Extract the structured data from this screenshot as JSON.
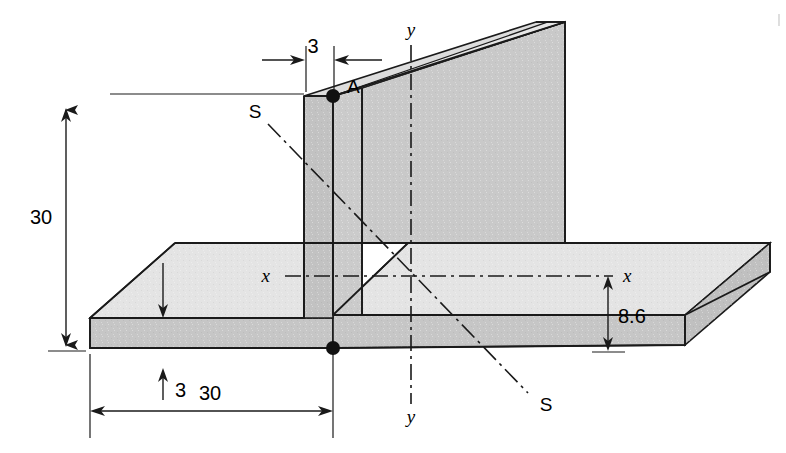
{
  "figure": {
    "background_color": "#ffffff",
    "line_color": "#1a1a1a",
    "fill_web_face": "#c9c9c9",
    "fill_web_edge": "#bdbdbd",
    "fill_flange_top": "#e2e2e2",
    "fill_flange_front": "#c4c4c4",
    "fill_flange_end": "#bfbfbf"
  },
  "dimensions": [
    {
      "id": "web-thickness",
      "value": "3",
      "orientation": "horizontal",
      "location": "top"
    },
    {
      "id": "web-height",
      "value": "30",
      "orientation": "vertical",
      "location": "left"
    },
    {
      "id": "flange-thickness",
      "value": "3",
      "orientation": "vertical",
      "location": "bottom-left"
    },
    {
      "id": "flange-half-width",
      "value": "30",
      "orientation": "horizontal",
      "location": "bottom"
    },
    {
      "id": "centroid-height",
      "value": "8.6",
      "orientation": "vertical",
      "location": "right"
    }
  ],
  "labels": {
    "point_a": "A",
    "axis_x_left": "x",
    "axis_x_right": "x",
    "axis_y_top": "y",
    "axis_y_bottom": "y",
    "section_s_upper": "S",
    "section_s_lower": "S"
  }
}
